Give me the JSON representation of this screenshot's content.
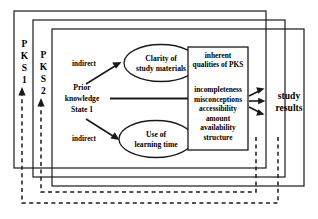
{
  "diagram": {
    "frames": [
      {
        "label_chars": [
          "P",
          "K",
          "S",
          "1"
        ],
        "label_text": "PKS 1",
        "name": "pks1"
      },
      {
        "label_chars": [
          "P",
          "K",
          "S",
          "2"
        ],
        "label_text": "PKS 2",
        "name": "pks2"
      },
      {
        "label_chars": [],
        "label_text": "",
        "name": "pks-current"
      }
    ],
    "nodes": {
      "prior_knowledge": {
        "lines": [
          "Prior",
          "knowledge",
          "State 1"
        ],
        "text": "Prior knowledge State 1"
      },
      "clarity": {
        "lines": [
          "Clarity of",
          "study materials"
        ],
        "text": "Clarity of study materials"
      },
      "learning_time": {
        "lines": [
          "Use of",
          "learning time"
        ],
        "text": "Use of learning time"
      },
      "qualities_box": {
        "heading_lines": [
          "inherent",
          "qualities of PKS"
        ],
        "heading": "inherent qualities of PKS",
        "items": [
          "incompleteness",
          "misconceptions",
          "accessibility",
          "amount",
          "availability",
          "structure"
        ]
      },
      "study_results": {
        "lines": [
          "study",
          "results"
        ],
        "text": "study results"
      }
    },
    "edge_labels": {
      "indirect_top": "indirect",
      "indirect_bottom": "indirect"
    },
    "colors": {
      "stroke": "#1a1a1a",
      "text": "#000000",
      "background": "#ffffff"
    }
  }
}
